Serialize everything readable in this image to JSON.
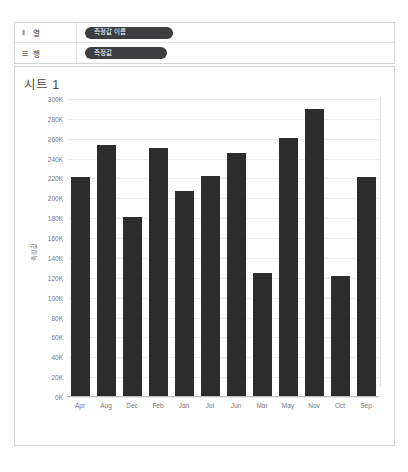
{
  "shelves": {
    "columns": {
      "label": "열",
      "icon": "columns-icon",
      "pill": "측정값 이름"
    },
    "rows": {
      "label": "행",
      "icon": "rows-icon",
      "pill": "측정값"
    }
  },
  "sheet": {
    "title": "시트 1"
  },
  "chart_data": {
    "type": "bar",
    "title": "시트 1",
    "xlabel": "",
    "ylabel": "측정값",
    "categories": [
      "Apr",
      "Aug",
      "Dec",
      "Feb",
      "Jan",
      "Jul",
      "Jun",
      "Mar",
      "May",
      "Nov",
      "Oct",
      "Sep"
    ],
    "values": [
      221000,
      254000,
      181000,
      251000,
      207000,
      222000,
      246000,
      125000,
      261000,
      290000,
      122000,
      221000
    ],
    "ylim": [
      0,
      300000
    ],
    "ytick_labels": [
      "300K",
      "280K",
      "260K",
      "240K",
      "220K",
      "200K",
      "180K",
      "160K",
      "140K",
      "120K",
      "100K",
      "80K",
      "60K",
      "40K",
      "20K",
      "0K"
    ],
    "ytick_values": [
      300000,
      280000,
      260000,
      240000,
      220000,
      200000,
      180000,
      160000,
      140000,
      120000,
      100000,
      80000,
      60000,
      40000,
      20000,
      0
    ],
    "grid": true,
    "legend": "none",
    "bar_color": "#2c2c2c",
    "grid_color": "#ededed",
    "axis_text_color": "#75757a"
  }
}
